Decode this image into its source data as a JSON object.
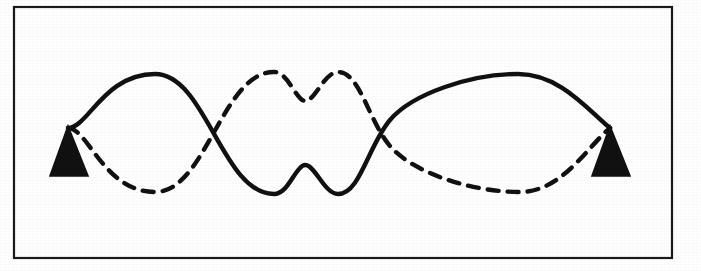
{
  "figure": {
    "background_color": "#ffffff",
    "ink_color": "#111111",
    "frame": {
      "x": 14,
      "y": 7,
      "width": 658,
      "height": 251,
      "stroke_width": 2.2,
      "color": "#1a1a1a"
    },
    "axis": {
      "centerline_y": 128,
      "left_node_x": 68,
      "right_node_x": 610,
      "span": 542
    },
    "supports": [
      {
        "name": "left-support",
        "apex_x": 68,
        "apex_y": 128,
        "base_left_x": 50,
        "base_right_x": 88,
        "base_y": 176,
        "fill": "#111111"
      },
      {
        "name": "right-support",
        "apex_x": 610,
        "apex_y": 128,
        "base_left_x": 592,
        "base_right_x": 630,
        "base_y": 176,
        "fill": "#111111"
      }
    ],
    "waves": [
      {
        "name": "solid-wave",
        "style": "solid",
        "stroke_width": 4.4,
        "color": "#111111",
        "phase": "positive-first",
        "amplitude": 55,
        "cycles": 1.5,
        "extrema": [
          {
            "kind": "crest",
            "x": 155,
            "y": 74
          },
          {
            "kind": "trough",
            "x": 338,
            "y": 194
          },
          {
            "kind": "crest",
            "x": 518,
            "y": 74
          }
        ],
        "dash_array": ""
      },
      {
        "name": "dashed-wave",
        "style": "dashed",
        "stroke_width": 4.4,
        "color": "#111111",
        "phase": "negative-first",
        "amplitude": 55,
        "cycles": 1.5,
        "extrema": [
          {
            "kind": "trough",
            "x": 155,
            "y": 192
          },
          {
            "kind": "crest",
            "x": 338,
            "y": 72
          },
          {
            "kind": "trough",
            "x": 520,
            "y": 192
          }
        ],
        "dash_array": "11 9"
      }
    ],
    "crossings": [
      {
        "name": "node-crossing-left",
        "x": 253,
        "y": 128
      },
      {
        "name": "node-crossing-right",
        "x": 430,
        "y": 130
      }
    ],
    "paths": {
      "solid": "M 68,128 C 88,128 104,74 155,74 C 206,74 222,194 274,194 C 286,194 292,176 300,168 C 312,154 322,194 338,194 C 360,194 368,146 390,120 C 412,94 470,74 518,74 C 560,74 588,110 610,128",
      "dashed": "M 68,128 C 88,128 104,192 155,192 C 206,192 222,72 274,72 C 286,72 292,90 300,98 C 312,112 322,72 338,72 C 360,72 368,120 390,146 C 412,172 470,192 520,192 C 562,192 588,146 610,128"
    }
  },
  "chart_data": {
    "type": "line",
    "xlabel": "",
    "ylabel": "",
    "xlim": [
      0,
      1.5
    ],
    "ylim": [
      -1,
      1
    ],
    "grid": false,
    "legend": "none",
    "annotations": [
      "left fixed support (filled triangle)",
      "right fixed support (filled triangle)",
      "solid curve and dashed curve are 180 degrees out of phase"
    ],
    "x": [
      0,
      0.125,
      0.25,
      0.375,
      0.5,
      0.625,
      0.75,
      0.875,
      1.0,
      1.125,
      1.25,
      1.375,
      1.5
    ],
    "series": [
      {
        "name": "solid-wave",
        "style": "solid",
        "values": [
          0,
          0.707,
          1.0,
          0.707,
          0,
          -0.707,
          -1.0,
          -0.707,
          0,
          0.707,
          1.0,
          0.707,
          0
        ]
      },
      {
        "name": "dashed-wave",
        "style": "dashed",
        "values": [
          0,
          -0.707,
          -1.0,
          -0.707,
          0,
          0.707,
          1.0,
          0.707,
          0,
          -0.707,
          -1.0,
          -0.707,
          0
        ]
      }
    ]
  }
}
